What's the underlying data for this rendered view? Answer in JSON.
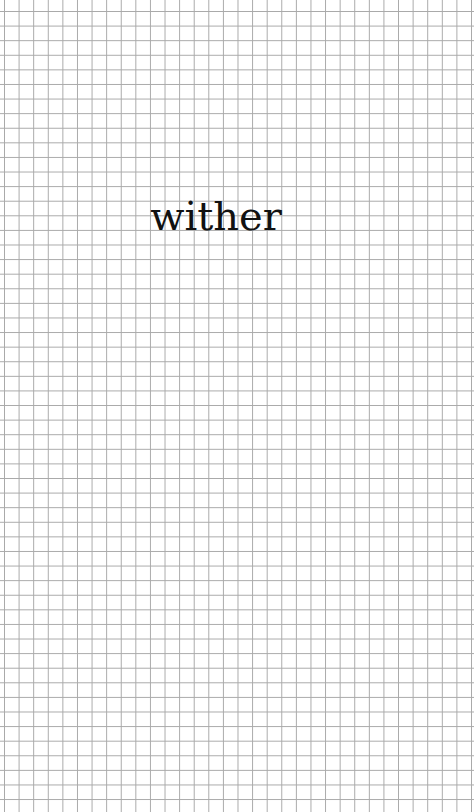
{
  "card": {
    "word": "wither",
    "background": "grid-paper",
    "text_color": "#111111",
    "grid_color": "#a9a9a9"
  }
}
